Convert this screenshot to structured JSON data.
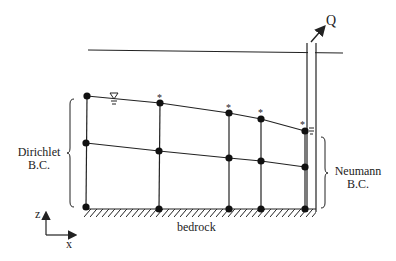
{
  "diagram": {
    "labels": {
      "discharge": "Q",
      "left_bc_line1": "Dirichlet",
      "left_bc_line2": "B.C.",
      "right_bc_line1": "Neumann",
      "right_bc_line2": "B.C.",
      "base": "bedrock",
      "axis_z": "z",
      "axis_x": "x",
      "water_table_symbol": "∇",
      "free_surface_marker": "*"
    },
    "grid": {
      "columns_x": [
        87,
        160,
        229,
        261,
        305
      ],
      "rows": {
        "top": [
          96,
          103,
          113,
          119,
          131
        ],
        "middle": [
          143,
          151,
          158,
          161,
          167
        ],
        "bottom": [
          207,
          209,
          209,
          209,
          209
        ]
      },
      "starred_nodes": [
        1,
        2,
        3,
        4
      ]
    },
    "colors": {
      "line": "#222222",
      "text": "#222222",
      "background": "#ffffff"
    }
  }
}
